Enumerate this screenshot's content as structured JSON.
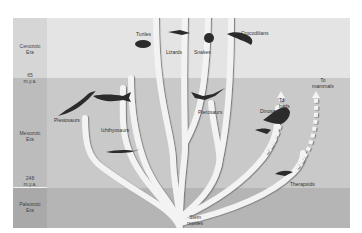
{
  "diagram": {
    "eras": [
      {
        "name": "Cenozoic Era",
        "line1": "Cenozoic",
        "line2": "Era"
      },
      {
        "name": "Mesozoic Era",
        "line1": "Mesozoic",
        "line2": "Era"
      },
      {
        "name": "Paleozoic Era",
        "line1": "Paleozoic",
        "line2": "Era"
      }
    ],
    "boundaries": [
      {
        "line1": "65",
        "line2": "m.y.a."
      },
      {
        "line1": "248",
        "line2": "m.y.a."
      }
    ],
    "groups": {
      "turtles": "Turtles",
      "lizards": "Lizards",
      "snakes": "Snakes",
      "crocodilians": "Crocodilians",
      "plesiosaurs": "Plesiosaurs",
      "ichthyosaurs": "Ichthyosaurs",
      "pterosaurs": "Pterosaurs",
      "dinosaurs": "Dinosaurs",
      "to_birds_1": "To",
      "to_birds_2": "birds",
      "to_mammals_1": "To",
      "to_mammals_2": "mammals",
      "therapsids": "Therapsids",
      "stem_reptiles_1": "Stem",
      "stem_reptiles_2": "reptiles"
    },
    "colors": {
      "cenozoic": "#e4e4e4",
      "mesozoic": "#c9c9c9",
      "paleozoic": "#b5b5b5",
      "branch": "#f4f4f4",
      "branch_shadow": "#8a8a8a"
    }
  }
}
